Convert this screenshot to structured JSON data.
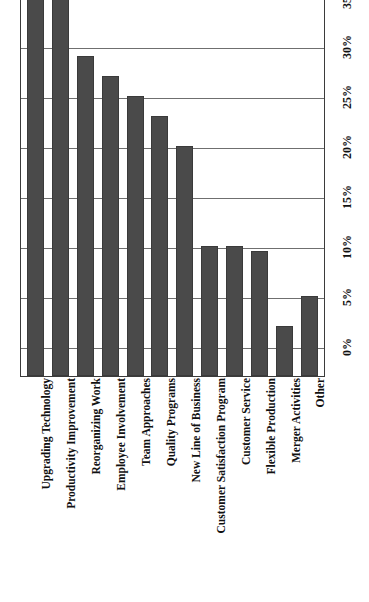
{
  "chart_data": {
    "type": "bar",
    "title": "Change Management Issues Due to Employee Skill Deficiencies",
    "xlabel": "",
    "ylabel": "",
    "orientation": "vertical",
    "grid": true,
    "legend": "none",
    "ylim": [
      0,
      40
    ],
    "ytick_labels": [
      "0%",
      "5%",
      "10%",
      "15%",
      "20%",
      "25%",
      "30%",
      "35%",
      "40%"
    ],
    "ytick_values": [
      0,
      5,
      10,
      15,
      20,
      25,
      30,
      35,
      40
    ],
    "categories": [
      "Upgrading Technology",
      "Productivity Improvement",
      "Reorganizing Work",
      "Employee Involvement",
      "Team Approaches",
      "Quality Programs",
      "New Line of Business",
      "Customer Satisfaction Program",
      "Customer Service",
      "Flexible Production",
      "Merger Activities",
      "Other"
    ],
    "values": [
      41,
      36.5,
      29,
      27,
      25,
      23,
      20,
      10,
      10,
      9.5,
      2,
      5
    ],
    "bar_color": "#4a4a4a",
    "gridline_color": "#6f6f6f",
    "axis_color": "#3b3b3b",
    "background_color": "#ffffff"
  }
}
